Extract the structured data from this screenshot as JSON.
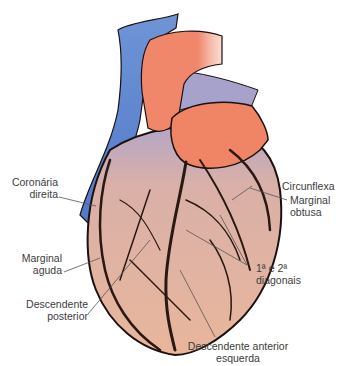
{
  "diagram": {
    "colors": {
      "aorta": "#f08a6c",
      "vena_cava": "#5f86d0",
      "pulmonary": "#a3a0c8",
      "myocardium": "#e8b49a",
      "vessels": "#2a1a14",
      "leader_lines": "#555555"
    },
    "labels": {
      "coronaria_direita": {
        "line1": "Coronária",
        "line2": "direita"
      },
      "marginal_aguda": {
        "line1": "Marginal",
        "line2": "aguda"
      },
      "descendente_posterior": {
        "line1": "Descendente",
        "line2": "posterior"
      },
      "circunflexa": {
        "line1": "Circunflexa"
      },
      "marginal_obtusa": {
        "line1": "Marginal",
        "line2": "obtusa"
      },
      "diagonais": {
        "line1": "1ª e 2ª",
        "line2": "diagonais"
      },
      "descendente_anterior_esquerda": {
        "line1": "Descendente anterior",
        "line2": "esquerda"
      }
    }
  }
}
